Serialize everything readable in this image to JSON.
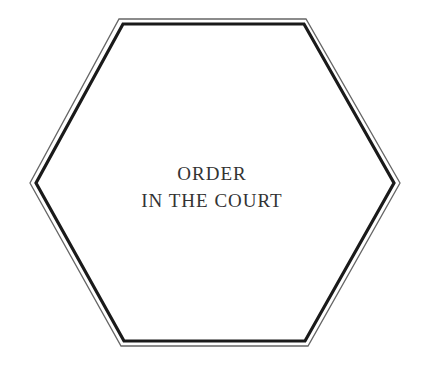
{
  "card": {
    "title_line1": "ORDER",
    "title_line2": "IN THE COURT",
    "shape": "hexagon",
    "colors": {
      "background": "#ffffff",
      "outer_border": "#555555",
      "inner_border": "#1a1a1a",
      "text": "#333333"
    }
  }
}
